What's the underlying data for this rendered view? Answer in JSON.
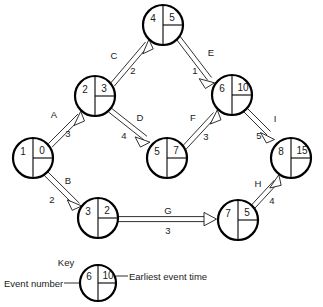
{
  "diagram": {
    "type": "activity-network-diagram",
    "nodes": [
      {
        "id": "n1",
        "event_number": "1",
        "earliest_event_time": "0",
        "cx": 33,
        "cy": 158,
        "r": 20
      },
      {
        "id": "n2",
        "event_number": "2",
        "earliest_event_time": "3",
        "cx": 95,
        "cy": 96,
        "r": 20
      },
      {
        "id": "n3",
        "event_number": "3",
        "earliest_event_time": "2",
        "cx": 98,
        "cy": 218,
        "r": 20
      },
      {
        "id": "n4",
        "event_number": "4",
        "earliest_event_time": "5",
        "cx": 163,
        "cy": 25,
        "r": 20
      },
      {
        "id": "n5",
        "event_number": "5",
        "earliest_event_time": "7",
        "cx": 167,
        "cy": 158,
        "r": 20
      },
      {
        "id": "n6",
        "event_number": "6",
        "earliest_event_time": "10",
        "cx": 232,
        "cy": 95,
        "r": 20
      },
      {
        "id": "n7",
        "event_number": "7",
        "earliest_event_time": "5",
        "cx": 238,
        "cy": 220,
        "r": 20
      },
      {
        "id": "n8",
        "event_number": "8",
        "earliest_event_time": "15",
        "cx": 291,
        "cy": 158,
        "r": 20
      }
    ],
    "edges": [
      {
        "id": "A",
        "activity": "A",
        "duration": "3",
        "from": "n1",
        "to": "n2",
        "label_x": 54,
        "label_y": 114,
        "duration_x": 68,
        "duration_y": 133
      },
      {
        "id": "B",
        "activity": "B",
        "duration": "2",
        "from": "n1",
        "to": "n3",
        "label_x": 68,
        "label_y": 180,
        "duration_x": 52,
        "duration_y": 199
      },
      {
        "id": "C",
        "activity": "C",
        "duration": "2",
        "from": "n2",
        "to": "n4",
        "label_x": 114,
        "label_y": 55,
        "duration_x": 133,
        "duration_y": 70
      },
      {
        "id": "D",
        "activity": "D",
        "duration": "4",
        "from": "n2",
        "to": "n5",
        "label_x": 140,
        "label_y": 117,
        "duration_x": 124,
        "duration_y": 135
      },
      {
        "id": "E",
        "activity": "E",
        "duration": "1",
        "from": "n4",
        "to": "n6",
        "label_x": 211,
        "label_y": 52,
        "duration_x": 195,
        "duration_y": 70
      },
      {
        "id": "F",
        "activity": "F",
        "duration": "3",
        "from": "n5",
        "to": "n6",
        "label_x": 193,
        "label_y": 117,
        "duration_x": 206,
        "duration_y": 136
      },
      {
        "id": "G",
        "activity": "G",
        "duration": "3",
        "from": "n3",
        "to": "n7",
        "label_x": 168,
        "label_y": 210,
        "duration_x": 168,
        "duration_y": 230
      },
      {
        "id": "H",
        "activity": "H",
        "duration": "4",
        "from": "n7",
        "to": "n8",
        "label_x": 258,
        "label_y": 183,
        "duration_x": 272,
        "duration_y": 200
      },
      {
        "id": "I",
        "activity": "I",
        "duration": "5",
        "from": "n6",
        "to": "n8",
        "label_x": 275,
        "label_y": 118,
        "duration_x": 259,
        "duration_y": 135
      }
    ],
    "key": {
      "title": "Key",
      "left_label": "Event number",
      "right_label": "Earliest event time",
      "node": {
        "event_number": "6",
        "earliest_event_time": "10",
        "cx": 98,
        "cy": 283,
        "r": 18
      }
    }
  }
}
